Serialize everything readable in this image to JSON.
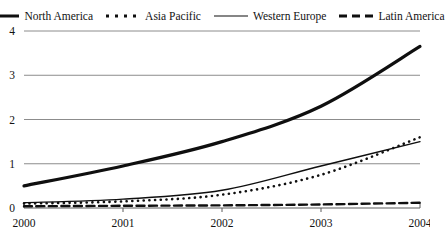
{
  "chart_data": {
    "type": "line",
    "title": "",
    "xlabel": "",
    "ylabel": "",
    "categories": [
      "2000",
      "2001",
      "2002",
      "2003",
      "2004"
    ],
    "x": [
      2000,
      2001,
      2002,
      2003,
      2004
    ],
    "ylim": [
      0,
      4
    ],
    "yticks": [
      0,
      1,
      2,
      3,
      4
    ],
    "ytick_labels": [
      "0",
      "1",
      "2",
      "3",
      "4"
    ],
    "grid": true,
    "legend_position": "top",
    "series": [
      {
        "name": "North America",
        "style": "thick-solid",
        "values": [
          0.5,
          0.95,
          1.5,
          2.3,
          3.65
        ]
      },
      {
        "name": "Asia Pacific",
        "style": "dotted",
        "values": [
          0.1,
          0.15,
          0.3,
          0.75,
          1.6
        ]
      },
      {
        "name": "Western Europe",
        "style": "thin-solid",
        "values": [
          0.12,
          0.2,
          0.4,
          0.95,
          1.5
        ]
      },
      {
        "name": "Latin America",
        "style": "dashed",
        "values": [
          0.04,
          0.05,
          0.06,
          0.08,
          0.12
        ]
      }
    ]
  },
  "legend": {
    "items": [
      {
        "label": "North America",
        "swatch": "thick-solid-line-icon"
      },
      {
        "label": "Asia Pacific",
        "swatch": "dotted-line-icon"
      },
      {
        "label": "Western Europe",
        "swatch": "thin-solid-line-icon"
      },
      {
        "label": "Latin America",
        "swatch": "dashed-line-icon"
      }
    ]
  },
  "axes": {
    "y_labels": [
      "4",
      "3",
      "2",
      "1",
      "0"
    ],
    "x_labels": [
      "2000",
      "2001",
      "2002",
      "2003",
      "2004"
    ]
  }
}
